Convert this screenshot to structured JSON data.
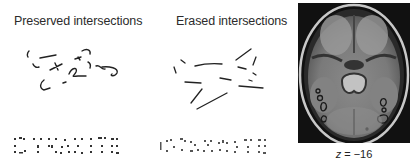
{
  "panels": [
    {
      "title": "Preserved intersections",
      "stimulus_word": "DYNAMITE",
      "condition": "preserved"
    },
    {
      "title": "Erased intersections",
      "stimulus_word": "DYNAMITE",
      "condition": "erased"
    }
  ],
  "brain_slice": {
    "view": "axial",
    "label_var": "z",
    "label_eq": " = ",
    "label_value": "−16"
  },
  "colors": {
    "text": "#2b2b2b",
    "stroke": "#222222",
    "mri_bg": "#111111",
    "roi_outline": "#1a1a1a"
  }
}
